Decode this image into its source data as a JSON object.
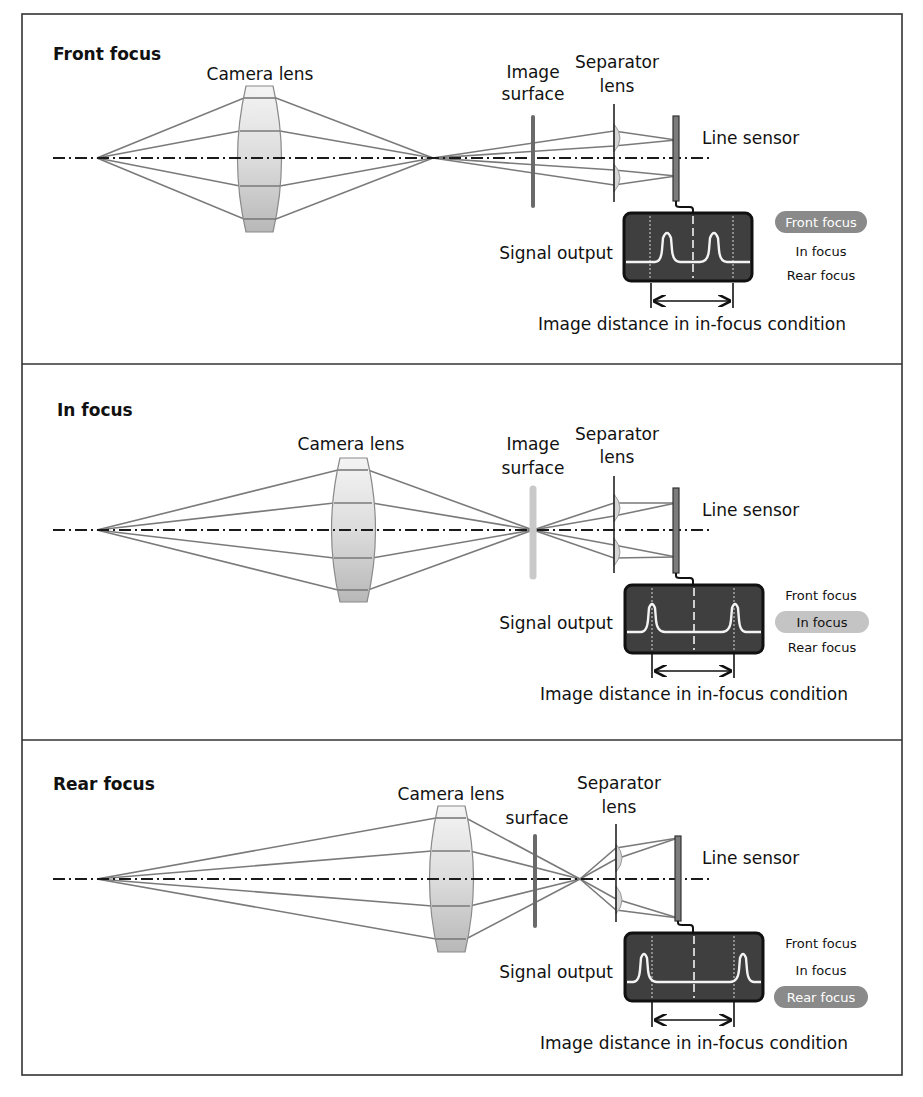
{
  "colors": {
    "background": "#ffffff",
    "ray": "#7a7a7a",
    "signal_box": "#3f3f3f",
    "highlight_pill_dark": "#8a8a8a",
    "highlight_pill_light": "#c4c4c4",
    "sensor": "#7c7c7c"
  },
  "labels": {
    "camera_lens": "Camera lens",
    "image_surface_line1": "Image",
    "image_surface_line2": "surface",
    "separator_line1": "Separator",
    "separator_line2": "lens",
    "line_sensor": "Line sensor",
    "signal_output": "Signal output",
    "image_distance": "Image distance in in-focus condition",
    "camera_lens_image_joined": "Camera lensImage"
  },
  "focus_states": [
    "Front focus",
    "In focus",
    "Rear focus"
  ],
  "panels": [
    {
      "title": "Front focus",
      "highlighted_state": "Front focus",
      "legend": [
        "Front focus",
        "In focus",
        "Rear focus"
      ]
    },
    {
      "title": "In focus",
      "highlighted_state": "In focus",
      "legend": [
        "Front focus",
        "In focus",
        "Rear focus"
      ]
    },
    {
      "title": "Rear focus",
      "highlighted_state": "Rear focus",
      "legend": [
        "Front focus",
        "In focus",
        "Rear focus"
      ]
    }
  ]
}
